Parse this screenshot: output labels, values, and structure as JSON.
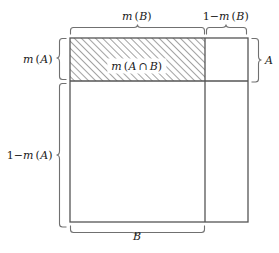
{
  "figure": {
    "kind": "measure-theory-unit-square-diagram"
  },
  "labels": {
    "top_left_bracket": "m (B)",
    "top_right_bracket": "1−m (B)",
    "left_upper_bracket": "m (A)",
    "left_lower_bracket": "1−m (A)",
    "right_bracket": "A",
    "bottom_bracket": "B",
    "intersection": "m (A ∩ B)"
  },
  "geometry": {
    "square": {
      "x": 70,
      "y": 38,
      "width": 178,
      "height": 184
    },
    "b_divider_x": 205,
    "a_divider_y": 81,
    "hatched_region": {
      "x": 70,
      "y": 38,
      "width": 135,
      "height": 43
    }
  },
  "colors": {
    "line": "#6b6b6b",
    "line_dark": "#3f3f3f",
    "hatch": "#8a8a8a",
    "text": "#1a1a1a",
    "background": "#ffffff"
  }
}
